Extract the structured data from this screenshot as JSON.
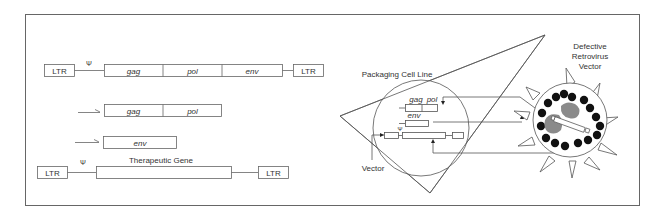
{
  "left": {
    "provirus": {
      "ltr_left": "LTR",
      "psi": "Ψ",
      "genes": [
        "gag",
        "pol",
        "env"
      ],
      "ltr_right": "LTR"
    },
    "construct_gagpol": {
      "genes": [
        "gag",
        "pol"
      ]
    },
    "construct_env": {
      "genes": [
        "env"
      ]
    },
    "vector": {
      "ltr_left": "LTR",
      "psi": "Ψ",
      "label": "Therapeutic Gene",
      "ltr_right": "LTR"
    }
  },
  "right": {
    "packaging_label": "Packaging Cell Line",
    "inner": {
      "gag": "gag",
      "pol": "pol",
      "env": "env",
      "psi": "Ψ"
    },
    "vector_label": "Vector",
    "virion_label_lines": [
      "Defective",
      "Retrovirus",
      "Vector"
    ]
  },
  "colors": {
    "line": "#555555",
    "fill_dark": "#111111",
    "fill_gray": "#8a8a8a"
  }
}
